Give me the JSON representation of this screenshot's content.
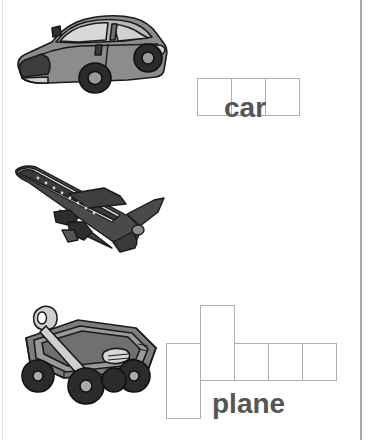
{
  "worksheet": {
    "type": "word-shape-spelling-worksheet",
    "background_color": "#ffffff",
    "rule_color": "#a9a9a9",
    "box_border_color": "#b0b0b0",
    "label_color": "#555555",
    "rows": [
      {
        "id": "car",
        "word": "car",
        "label": "car",
        "picture_name": "car-illustration",
        "picture_description": "gray sedan car, three-quarter front view",
        "letter_count": 3,
        "letters": [
          "c",
          "a",
          "r"
        ],
        "cell_shapes": [
          "x",
          "x",
          "x"
        ]
      },
      {
        "id": "plane",
        "word": "plane",
        "label": "plane",
        "picture_name": "plane-illustration",
        "picture_description": "dark gray jet airliner climbing, three-quarter view",
        "letter_count": 5,
        "letters": [
          "p",
          "l",
          "a",
          "n",
          "e"
        ],
        "cell_shapes": [
          "descender",
          "ascender",
          "x",
          "x",
          "x"
        ]
      },
      {
        "id": "wagon",
        "word": "wagon",
        "label": "wagon",
        "picture_name": "wagon-illustration",
        "picture_description": "gray pull wagon with raised handle and four black tires",
        "letter_count": 5,
        "letters": [
          "w",
          "a",
          "g",
          "o",
          "n"
        ],
        "cell_shapes": [
          "x",
          "x",
          "descender",
          "x",
          "x"
        ]
      }
    ]
  }
}
